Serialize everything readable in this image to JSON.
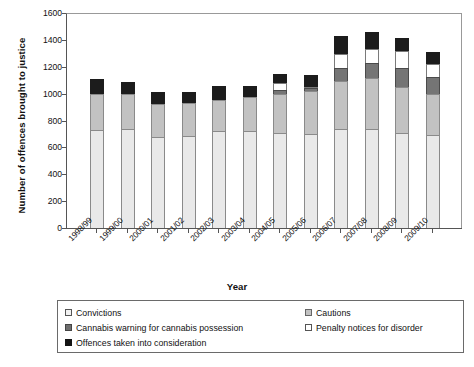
{
  "chart_data": {
    "type": "bar",
    "subtype": "stacked-bar",
    "title": "",
    "xlabel": "Year",
    "ylabel": "Number of offences brought to justice",
    "ylim": [
      0,
      1600
    ],
    "yticks": [
      0,
      200,
      400,
      600,
      800,
      1000,
      1200,
      1400,
      1600
    ],
    "grid": false,
    "legend_position": "bottom",
    "categories": [
      "1998/99",
      "1999/00",
      "2000/01",
      "2001/02",
      "2002/03",
      "2003/04",
      "2004/05",
      "2005/06",
      "2006/07",
      "2007/08",
      "2008/09",
      "2009/10"
    ],
    "series": [
      {
        "name": "Convictions",
        "color": "#e9e9e9",
        "values": [
          730,
          735,
          675,
          685,
          720,
          720,
          705,
          700,
          735,
          740,
          710,
          690
        ]
      },
      {
        "name": "Cautions",
        "color": "#c2c2c2",
        "values": [
          270,
          265,
          250,
          245,
          230,
          255,
          290,
          320,
          360,
          375,
          340,
          310
        ]
      },
      {
        "name": "Cannabis warning for cannabis possession",
        "color": "#757575",
        "values": [
          0,
          0,
          0,
          0,
          0,
          0,
          35,
          20,
          95,
          110,
          140,
          125
        ]
      },
      {
        "name": "Penalty notices for disorder",
        "color": "#ffffff",
        "values": [
          0,
          0,
          0,
          0,
          0,
          0,
          50,
          10,
          105,
          110,
          130,
          95
        ]
      },
      {
        "name": "Offences taken into consideration",
        "color": "#1c1c1c",
        "values": [
          110,
          90,
          85,
          85,
          105,
          85,
          65,
          85,
          135,
          120,
          95,
          90
        ]
      }
    ],
    "totals": [
      1110,
      1090,
      1010,
      1015,
      1055,
      1060,
      1145,
      1135,
      1430,
      1455,
      1415,
      1310
    ]
  },
  "legend": {
    "items": [
      {
        "label": "Convictions",
        "swatch": "swatch-convictions"
      },
      {
        "label": "Cautions",
        "swatch": "swatch-cautions"
      },
      {
        "label": "Cannabis warning for cannabis possession",
        "swatch": "swatch-cannabis"
      },
      {
        "label": "Penalty notices for disorder",
        "swatch": "swatch-penalty"
      },
      {
        "label": "Offences taken into consideration",
        "swatch": "swatch-otic"
      }
    ]
  }
}
